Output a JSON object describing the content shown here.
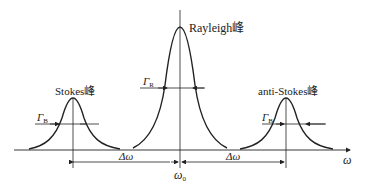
{
  "diagram": {
    "peaks": {
      "rayleigh": {
        "label": "Rayleigh峰",
        "width_symbol": "Γ",
        "width_sub": "R"
      },
      "stokes": {
        "label": "Stokes峰",
        "width_symbol": "Γ",
        "width_sub": "B"
      },
      "anti_stokes": {
        "label": "anti-Stokes峰",
        "width_symbol": "Γ",
        "width_sub": "B"
      }
    },
    "axis": {
      "label": "ω",
      "center_label": "ω",
      "center_sub": "0"
    },
    "shift_labels": [
      "Δω",
      "Δω"
    ],
    "colors": {
      "line": "#222222",
      "background": "#ffffff"
    }
  }
}
